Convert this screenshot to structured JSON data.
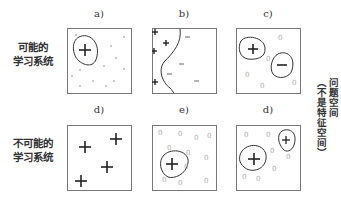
{
  "row_labels": [
    "可能的\n学习系统",
    "不可能的\n学习系统"
  ],
  "row_label_lines": [
    [
      "可能的",
      "学习系统"
    ],
    [
      "不可能的",
      "学习系统"
    ]
  ],
  "panels": [
    {
      "id": "a",
      "label": "a)"
    },
    {
      "id": "b",
      "label": "b)"
    },
    {
      "id": "c",
      "label": "c)"
    },
    {
      "id": "d",
      "label": "d)"
    },
    {
      "id": "e",
      "label": "e)"
    },
    {
      "id": "d2",
      "label": "d)"
    }
  ],
  "side_label": {
    "line1": "问题空间",
    "line2": "（不是特征空间）"
  },
  "symbols": {
    "plus": "+",
    "minus": "−",
    "zero": "0"
  }
}
